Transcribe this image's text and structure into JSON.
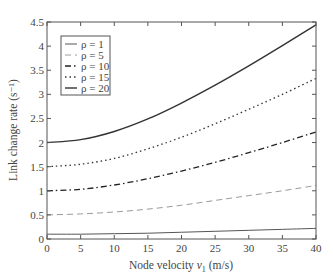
{
  "chart_data": {
    "type": "line",
    "title": "",
    "xlabel": "Node velocity v1 (m/s)",
    "xlabel_parts": {
      "main": "Node velocity ",
      "var": "v",
      "sub": "1",
      "unit": " (m/s)"
    },
    "ylabel": "Link change rate (s⁻¹)",
    "xlim": [
      0,
      40
    ],
    "ylim": [
      0,
      4.5
    ],
    "xticks": [
      0,
      5,
      10,
      15,
      20,
      25,
      30,
      35,
      40
    ],
    "yticks": [
      0,
      0.5,
      1,
      1.5,
      2,
      2.5,
      3,
      3.5,
      4,
      4.5
    ],
    "ytick_labels": [
      "0",
      "0.5",
      "1",
      "1.5",
      "2",
      "2.5",
      "3",
      "3.5",
      "4",
      "4.5"
    ],
    "grid": false,
    "legend_position": "upper left",
    "x": [
      0,
      5,
      10,
      15,
      20,
      25,
      30,
      35,
      40
    ],
    "series": [
      {
        "name": "ρ = 1",
        "style": "solid",
        "color": "#555555",
        "width": 1.0,
        "values": [
          0.1,
          0.1,
          0.11,
          0.12,
          0.14,
          0.16,
          0.18,
          0.2,
          0.22
        ]
      },
      {
        "name": "ρ = 5",
        "style": "dashed",
        "color": "#9a9a9a",
        "width": 1.0,
        "values": [
          0.5,
          0.52,
          0.56,
          0.62,
          0.7,
          0.8,
          0.9,
          1.0,
          1.11
        ]
      },
      {
        "name": "ρ = 10",
        "style": "dashdot",
        "color": "#222222",
        "width": 1.3,
        "values": [
          1.0,
          1.03,
          1.12,
          1.25,
          1.41,
          1.59,
          1.79,
          2.0,
          2.22
        ]
      },
      {
        "name": "ρ = 15",
        "style": "dotted",
        "color": "#333333",
        "width": 1.3,
        "values": [
          1.5,
          1.55,
          1.67,
          1.87,
          2.11,
          2.39,
          2.69,
          3.0,
          3.33
        ]
      },
      {
        "name": "ρ = 20",
        "style": "solid",
        "color": "#333333",
        "width": 1.4,
        "values": [
          2.0,
          2.06,
          2.23,
          2.49,
          2.82,
          3.19,
          3.59,
          4.01,
          4.44
        ]
      }
    ]
  }
}
